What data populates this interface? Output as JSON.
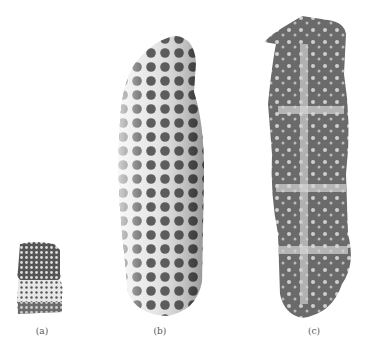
{
  "figure": {
    "panels": [
      {
        "id": "a",
        "label": "(a)",
        "description": "small fossil specimen, two-segment, pitted surface"
      },
      {
        "id": "b",
        "label": "(b)",
        "description": "elongated fossil specimen with honeycomb-like pits"
      },
      {
        "id": "c",
        "label": "(c)",
        "description": "elongated fossil specimen, sectioned view with chambers"
      }
    ],
    "colors": {
      "background": "#ffffff",
      "specimen_dark": "#3a3a3a",
      "specimen_mid": "#7a7a7a",
      "specimen_light": "#d8d8d8"
    }
  }
}
